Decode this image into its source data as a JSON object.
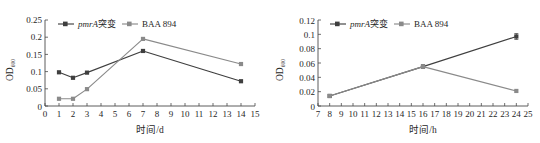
{
  "figure": {
    "panels": [
      {
        "id": "panel-left",
        "y_axis_label_main": "OD",
        "y_axis_label_sub": "600",
        "x_axis_label": "时间/d",
        "y_ticks": [
          "0",
          "0.05",
          "0.1",
          "0.15",
          "0.2",
          "0.25"
        ],
        "x_ticks": [
          "0",
          "1",
          "2",
          "3",
          "4",
          "5",
          "6",
          "7",
          "8",
          "9",
          "10",
          "11",
          "12",
          "13",
          "14",
          "15"
        ],
        "legend": [
          {
            "label": "pmrA突变",
            "italic_part": "pmrA",
            "color": "#3f3f3f",
            "marker": "square"
          },
          {
            "label": "BAA 894",
            "italic_part": "",
            "color": "#8a8a8a",
            "marker": "square"
          }
        ]
      },
      {
        "id": "panel-right",
        "y_axis_label_main": "OD",
        "y_axis_label_sub": "600",
        "x_axis_label": "时间/h",
        "y_ticks": [
          "0",
          "0.02",
          "0.04",
          "0.06",
          "0.08",
          "0.1",
          "0.12"
        ],
        "x_ticks": [
          "7",
          "8",
          "9",
          "10",
          "11",
          "12",
          "13",
          "14",
          "15",
          "16",
          "17",
          "18",
          "19",
          "20",
          "21",
          "22",
          "23",
          "24",
          "25"
        ],
        "legend": [
          {
            "label": "pmrA突变",
            "italic_part": "pmrA",
            "color": "#3f3f3f",
            "marker": "square"
          },
          {
            "label": "BAA 894",
            "italic_part": "",
            "color": "#8a8a8a",
            "marker": "square"
          }
        ]
      }
    ]
  },
  "chart_data": [
    {
      "type": "line",
      "id": "left-growth-curve-days",
      "title": "",
      "xlabel": "时间/d",
      "ylabel": "OD600",
      "xlim": [
        0,
        15
      ],
      "ylim": [
        0,
        0.25
      ],
      "ytick_step": 0.05,
      "xtick_step": 1,
      "grid": false,
      "legend_position": "top-center",
      "x": [
        1,
        2,
        3,
        7,
        14
      ],
      "series": [
        {
          "name": "pmrA突变",
          "color": "#3f3f3f",
          "marker": "square",
          "values": [
            0.098,
            0.082,
            0.097,
            0.16,
            0.072
          ]
        },
        {
          "name": "BAA 894",
          "color": "#8a8a8a",
          "marker": "square",
          "values": [
            0.021,
            0.021,
            0.049,
            0.195,
            0.122
          ]
        }
      ]
    },
    {
      "type": "line",
      "id": "right-growth-curve-hours",
      "title": "",
      "xlabel": "时间/h",
      "ylabel": "OD600",
      "xlim": [
        7,
        25
      ],
      "ylim": [
        0,
        0.12
      ],
      "ytick_step": 0.02,
      "xtick_step": 1,
      "grid": false,
      "legend_position": "top-center",
      "x": [
        8,
        16,
        24
      ],
      "series": [
        {
          "name": "pmrA突变",
          "color": "#3f3f3f",
          "marker": "square",
          "values": [
            0.014,
            0.055,
            0.097
          ],
          "errors": [
            0.0,
            0.002,
            0.004
          ]
        },
        {
          "name": "BAA 894",
          "color": "#8a8a8a",
          "marker": "square",
          "values": [
            0.014,
            0.055,
            0.021
          ],
          "errors": [
            0.0,
            0.002,
            0.0
          ]
        }
      ]
    }
  ]
}
